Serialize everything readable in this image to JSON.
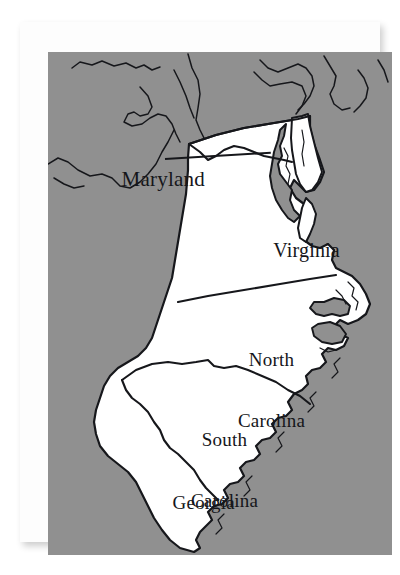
{
  "figure": {
    "kind": "printed-reference-map",
    "background_color": "#ffffff",
    "mat_color": "#fdfdfd",
    "plate_color": "#909090",
    "highlight_color": "#ffffff",
    "ink_color": "#16171b",
    "caption": ""
  },
  "map": {
    "region_title": "",
    "labels": [
      {
        "id": "maryland",
        "name": "Maryland",
        "lines": [
          "Maryland"
        ],
        "placement": "outside-left-with-leader",
        "has_leader_line": true
      },
      {
        "id": "virginia",
        "name": "Virginia",
        "lines": [
          "Virginia"
        ],
        "placement": "inside",
        "has_leader_line": false
      },
      {
        "id": "north-carolina",
        "name": "North Carolina",
        "lines": [
          "North",
          "Carolina"
        ],
        "placement": "inside",
        "has_leader_line": false
      },
      {
        "id": "south-carolina",
        "name": "South Carolina",
        "lines": [
          "South",
          "Carolina"
        ],
        "placement": "inside",
        "has_leader_line": false
      },
      {
        "id": "georgia",
        "name": "Georgia",
        "lines": [
          "Georgia"
        ],
        "placement": "inside",
        "has_leader_line": false
      }
    ],
    "highlighted_states": [
      "Maryland",
      "Virginia",
      "North Carolina",
      "South Carolina",
      "Georgia"
    ],
    "water_bodies_depicted": [
      "Chesapeake Bay",
      "Pamlico Sound",
      "Albemarle Sound",
      "Delaware Bay",
      "Atlantic Ocean"
    ],
    "features": [
      "Delmarva Peninsula",
      "Outer Banks",
      "coastal rivers"
    ]
  }
}
